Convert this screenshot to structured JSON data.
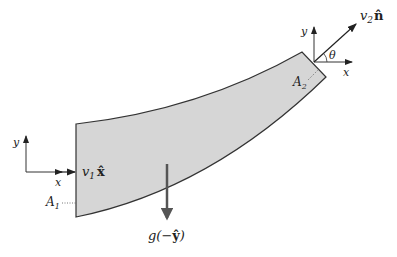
{
  "diagram": {
    "colors": {
      "pipe_fill": "#d6d6d6",
      "pipe_stroke": "#333333",
      "arrow": "#222222",
      "gravity_arrow": "#555555"
    },
    "inlet": {
      "axis_y_label": "y",
      "axis_x_label": "x",
      "velocity_label_var": "v",
      "velocity_label_sub": "1",
      "velocity_label_vec": "x̂",
      "area_label_var": "A",
      "area_label_sub": "1"
    },
    "outlet": {
      "axis_y_label": "y",
      "axis_x_label": "x",
      "angle_label": "θ",
      "velocity_label_var": "v",
      "velocity_label_sub": "2",
      "velocity_label_vec": "n̂",
      "area_label_var": "A",
      "area_label_sub": "2"
    },
    "gravity": {
      "label_prefix": "g(−",
      "label_vec": "ŷ",
      "label_suffix": ")"
    }
  }
}
